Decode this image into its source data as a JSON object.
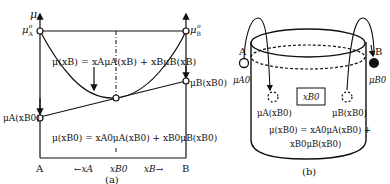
{
  "panel_a": {
    "caption": "(a)",
    "y_axis_label": "μ",
    "mu_A0": {
      "main": "μ",
      "sub": "A",
      "sup": "o"
    },
    "mu_B0": {
      "main": "μ",
      "sub": "B",
      "sup": "o"
    },
    "mu_A_xB0": "μA(xB0)",
    "mu_B_xB0": "μB(xB0)",
    "curve_equation": "μ(xB) = xAμA(xB) + xBμB(xB)",
    "tangent_equation": "μ(xB0) = xA0μA(xB0) + xB0μB(xB0)",
    "x_left": "A",
    "x_right": "B",
    "x_arrow_left": "←xA",
    "x_mid": "xB0",
    "x_arrow_right": "xB→"
  },
  "panel_b": {
    "caption": "(b)",
    "label_A": "A",
    "label_B": "B",
    "mu_A0": "μA0",
    "mu_B0": "μB0",
    "box_label": "xB0",
    "mu_A_xB0": "μA(xB0)",
    "mu_B_xB0": "μB(xB0)",
    "equation_line1": "μ(xB0) = xA0μA(xB0) +",
    "equation_line2": "xB0μB(xB0)"
  }
}
